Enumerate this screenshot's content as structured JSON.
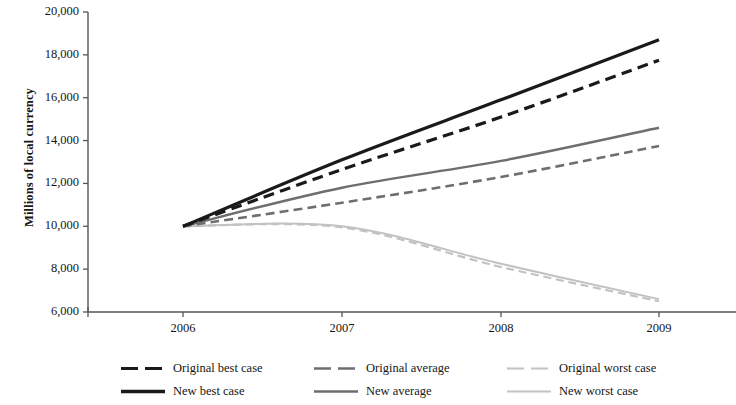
{
  "chart_data": {
    "type": "line",
    "title": "",
    "xlabel": "",
    "ylabel": "Millions of local currency",
    "x": [
      2006,
      2007,
      2008,
      2009
    ],
    "xlim": [
      2006,
      2009
    ],
    "ylim": [
      6000,
      20000
    ],
    "ytick_labels": [
      "20,000",
      "18,000",
      "16,000",
      "14,000",
      "12,000",
      "10,000",
      "8,000",
      "6,000"
    ],
    "ytick_values": [
      20000,
      18000,
      16000,
      14000,
      12000,
      10000,
      8000,
      6000
    ],
    "xtick_labels": [
      "2006",
      "2007",
      "2008",
      "2009"
    ],
    "grid": false,
    "legend_position": "bottom",
    "series": [
      {
        "name": "Original best case",
        "values": [
          10000,
          12650,
          15100,
          17750
        ],
        "color": "#1a1a1a",
        "style": "dashed",
        "width": 3.2
      },
      {
        "name": "Original average",
        "values": [
          10000,
          11100,
          12300,
          13750
        ],
        "color": "#6e6e6e",
        "style": "dashed",
        "width": 2.6
      },
      {
        "name": "Original worst case",
        "values": [
          10000,
          9950,
          8100,
          6500
        ],
        "color": "#c2c2c2",
        "style": "dashed",
        "width": 2.2
      },
      {
        "name": "New best case",
        "values": [
          10000,
          13100,
          15900,
          18700
        ],
        "color": "#1a1a1a",
        "style": "solid",
        "width": 3.2
      },
      {
        "name": "New average",
        "values": [
          10000,
          11800,
          13050,
          14600
        ],
        "color": "#6e6e6e",
        "style": "solid",
        "width": 2.4
      },
      {
        "name": "New worst case",
        "values": [
          10000,
          10000,
          8250,
          6600
        ],
        "color": "#c2c2c2",
        "style": "solid",
        "width": 2.0
      }
    ]
  },
  "axis": {
    "y_title": "Millions of local currency",
    "y_labels": [
      "20,000",
      "18,000",
      "16,000",
      "14,000",
      "12,000",
      "10,000",
      "8,000",
      "6,000"
    ],
    "x_labels": [
      "2006",
      "2007",
      "2008",
      "2009"
    ],
    "axis_color": "#55555a"
  },
  "legend": {
    "entries": [
      {
        "label": "Original best case",
        "color": "#1a1a1a",
        "style": "dashed",
        "width": 3.2
      },
      {
        "label": "Original average",
        "color": "#6e6e6e",
        "style": "dashed",
        "width": 2.6
      },
      {
        "label": "Original worst case",
        "color": "#c2c2c2",
        "style": "dashed",
        "width": 2.2
      },
      {
        "label": "New best case",
        "color": "#1a1a1a",
        "style": "solid",
        "width": 3.4
      },
      {
        "label": "New average",
        "color": "#6e6e6e",
        "style": "solid",
        "width": 2.6
      },
      {
        "label": "New worst case",
        "color": "#c2c2c2",
        "style": "solid",
        "width": 2.2
      }
    ]
  }
}
